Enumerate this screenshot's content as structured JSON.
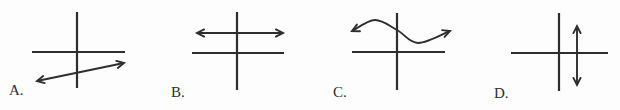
{
  "figure": {
    "width": 620,
    "height": 110,
    "background": "#fdfdfd",
    "ink": "#2e2e2e",
    "axis_stroke_width": 2.2,
    "arrow_stroke_width": 1.9
  },
  "arrowhead": {
    "length": 8,
    "angle_deg": 27,
    "ends": "both"
  },
  "panels": [
    {
      "label": "A.",
      "label_pos": [
        9,
        95
      ],
      "graph": "line-positive-slope-double-arrow-below-x-axis",
      "axes": {
        "y_axis": {
          "x": 77,
          "y1": 12,
          "y2": 88
        },
        "x_axis": {
          "y": 52,
          "x1": 32,
          "x2": 125
        }
      },
      "shape": {
        "type": "segment",
        "points": [
          [
            37,
            81
          ],
          [
            124,
            63
          ]
        ]
      }
    },
    {
      "label": "B.",
      "label_pos": [
        171,
        97
      ],
      "graph": "horizontal-double-arrow-above-x-axis",
      "axes": {
        "y_axis": {
          "x": 237,
          "y1": 12,
          "y2": 90
        },
        "x_axis": {
          "y": 53,
          "x1": 192,
          "x2": 284
        }
      },
      "shape": {
        "type": "segment",
        "points": [
          [
            197,
            33
          ],
          [
            283,
            33
          ]
        ]
      }
    },
    {
      "label": "C.",
      "label_pos": [
        333,
        97
      ],
      "graph": "wavy-curve-double-arrow-above-x-axis",
      "axes": {
        "y_axis": {
          "x": 397,
          "y1": 13,
          "y2": 90
        },
        "x_axis": {
          "y": 52,
          "x1": 352,
          "x2": 445
        }
      },
      "shape": {
        "type": "curve",
        "points": [
          [
            352,
            31
          ],
          [
            375,
            20
          ],
          [
            397,
            30
          ],
          [
            418,
            43
          ],
          [
            450,
            31
          ]
        ]
      }
    },
    {
      "label": "D.",
      "label_pos": [
        494,
        98
      ],
      "graph": "vertical-double-arrow-right-of-y-axis",
      "axes": {
        "y_axis": {
          "x": 559,
          "y1": 13,
          "y2": 91
        },
        "x_axis": {
          "y": 53,
          "x1": 511,
          "x2": 608
        }
      },
      "shape": {
        "type": "segment",
        "points": [
          [
            577,
            26
          ],
          [
            577,
            85
          ]
        ]
      }
    }
  ]
}
